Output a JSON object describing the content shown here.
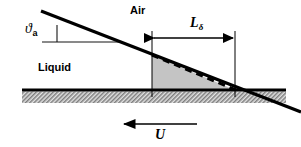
{
  "figure": {
    "background_color": "#ffffff",
    "width": 301,
    "height": 147
  },
  "labels": {
    "air": "Air",
    "liquid": "Liquid",
    "length_symbol": "L",
    "length_subscript": "δ",
    "angle_symbol": "ϑ",
    "angle_subscript": "a",
    "velocity": "U"
  },
  "colors": {
    "line": "#000000",
    "wedge_fill": "#c4c4c4",
    "wall_hatch": "#8a8a8a",
    "wall_band": "#d9d9d9",
    "thin_line": "#1a1a1a"
  },
  "geometry": {
    "interface_line": {
      "x1": 42,
      "y1": 12,
      "x2": 301,
      "y2": 113,
      "width": 3
    },
    "angle_reference_line": {
      "x1": 42,
      "y1": 42,
      "x2": 120,
      "y2": 42
    },
    "angle_tick_line": {
      "x1": 57,
      "y1": 26,
      "x2": 57,
      "y2": 42
    },
    "wedge_left_x": 152,
    "wedge_right_x": 235,
    "wall_top_y": 90,
    "wall_bottom_y": 103,
    "dashed_line": {
      "x1": 152,
      "y1": 55,
      "x2": 235,
      "y2": 90,
      "dash": "7 5",
      "width": 3
    },
    "dimension_arrow": {
      "x1": 152,
      "y1": 38,
      "x2": 235,
      "y2": 38
    },
    "velocity_arrow": {
      "x1": 196,
      "y1": 124,
      "x2": 122,
      "y2": 124
    },
    "vertical_left": {
      "x": 152,
      "y1": 31,
      "y2": 97
    },
    "vertical_right": {
      "x": 235,
      "y1": 31,
      "y2": 97
    }
  },
  "elements": {
    "interface": "liquid-air-interface-line",
    "dashed_interface": "dashed-deformed-interface",
    "wedge": "shaded-dynamic-wetting-wedge",
    "wall": "hatched-solid-wall",
    "dimension": "length-dimension-arrow",
    "velocity": "wall-velocity-arrow"
  }
}
